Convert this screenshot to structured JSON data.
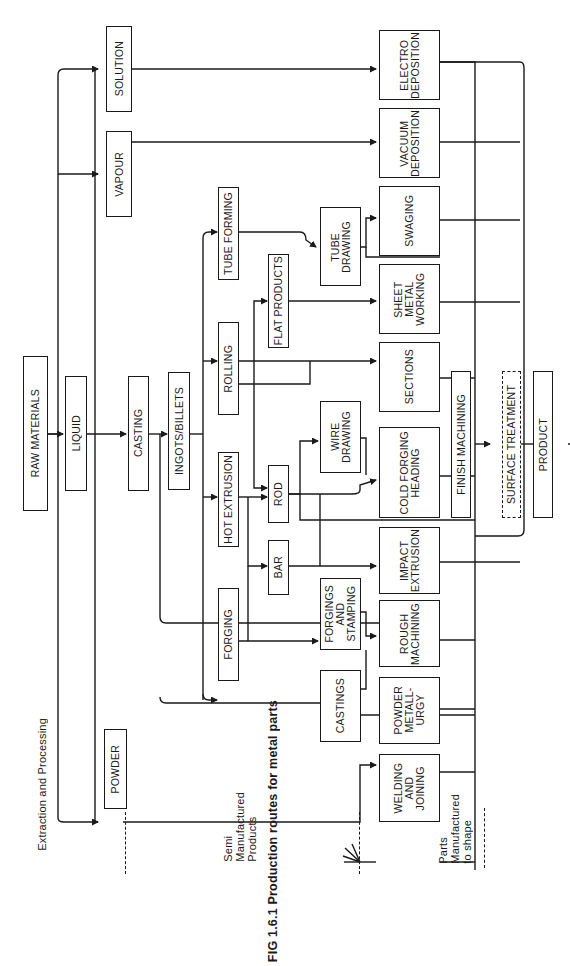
{
  "figure": {
    "caption": "FIG 1.6.1 Production routes for metal parts",
    "stage_labels": {
      "extraction": "Extraction and Processing",
      "semi": "Semi\nManufactured\nProducts",
      "parts": "Parts\nManufactured\nto shape"
    }
  },
  "nodes": {
    "raw_materials": "RAW MATERIALS",
    "liquid": "LIQUID",
    "powder": "POWDER",
    "vapour": "VAPOUR",
    "solution": "SOLUTION",
    "casting": "CASTING",
    "ingots_billets": "INGOTS/BILLETS",
    "forging": "FORGING",
    "hot_extrusion": "HOT EXTRUSION",
    "rolling": "ROLLING",
    "tube_forming": "TUBE FORMING",
    "castings": "CASTINGS",
    "forgings_stamping": "FORGINGS\nAND\nSTAMPING",
    "bar": "BAR",
    "rod": "ROD",
    "flat_products": "FLAT PRODUCTS",
    "wire_drawing": "WIRE\nDRAWING",
    "tube_drawing": "TUBE\nDRAWING",
    "welding_joining": "WELDING\nAND\nJOINING",
    "powder_metallurgy": "POWDER\nMETALL-\nURGY",
    "rough_machining": "ROUGH\nMACHINING",
    "impact_extrusion": "IMPACT\nEXTRUSION",
    "cold_forging": "COLD FORGING\nHEADING",
    "sections": "SECTIONS",
    "sheet_metal": "SHEET\nMETAL\nWORKING",
    "swaging": "SWAGING",
    "vacuum_deposition": "VACUUM\nDEPOSITION",
    "electro_deposition": "ELECTRO\nDEPOSITION",
    "finish_machining": "FINISH MACHINING",
    "surface_treatment": "SURFACE TREATMENT",
    "product": "PRODUCT"
  },
  "edges": [
    [
      "raw_materials",
      "liquid"
    ],
    [
      "raw_materials",
      "powder"
    ],
    [
      "raw_materials",
      "vapour"
    ],
    [
      "raw_materials",
      "solution"
    ],
    [
      "liquid",
      "casting"
    ],
    [
      "casting",
      "ingots_billets"
    ],
    [
      "casting",
      "castings"
    ],
    [
      "ingots_billets",
      "forging"
    ],
    [
      "ingots_billets",
      "hot_extrusion"
    ],
    [
      "ingots_billets",
      "rolling"
    ],
    [
      "ingots_billets",
      "tube_forming"
    ],
    [
      "forging",
      "forgings_stamping"
    ],
    [
      "forging",
      "bar"
    ],
    [
      "hot_extrusion",
      "bar"
    ],
    [
      "hot_extrusion",
      "rod"
    ],
    [
      "rolling",
      "rod"
    ],
    [
      "rolling",
      "flat_products"
    ],
    [
      "rolling",
      "sections"
    ],
    [
      "tube_forming",
      "tube_drawing"
    ],
    [
      "flat_products",
      "sheet_metal"
    ],
    [
      "rod",
      "wire_drawing"
    ],
    [
      "rod",
      "cold_forging"
    ],
    [
      "rod",
      "finish_machining"
    ],
    [
      "wire_drawing",
      "cold_forging"
    ],
    [
      "bar",
      "impact_extrusion"
    ],
    [
      "tube_drawing",
      "swaging"
    ],
    [
      "castings",
      "rough_machining"
    ],
    [
      "forgings_stamping",
      "rough_machining"
    ],
    [
      "powder",
      "powder_metallurgy"
    ],
    [
      "vapour",
      "vacuum_deposition"
    ],
    [
      "solution",
      "electro_deposition"
    ],
    [
      "finish_machining",
      "surface_treatment"
    ],
    [
      "surface_treatment",
      "product"
    ]
  ]
}
